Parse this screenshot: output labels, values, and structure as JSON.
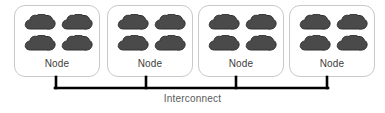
{
  "diagram": {
    "colors": {
      "cloud_fill": "#4a4a4a",
      "cloud_stroke": "#2e2e2e",
      "box_border": "#c9c9c9",
      "bus_line": "#000000",
      "node_label_color": "#3d3d3d",
      "interconnect_label_color": "#5a5a5a",
      "background": "#ffffff"
    },
    "nodes": [
      {
        "label": "Node",
        "x": 14,
        "processors": [
          "cloud-shape",
          "cloud-shape",
          "cloud-shape",
          "cloud-shape"
        ]
      },
      {
        "label": "Node",
        "x": 107,
        "processors": [
          "cloud-shape",
          "cloud-shape",
          "cloud-shape",
          "cloud-shape"
        ]
      },
      {
        "label": "Node",
        "x": 198,
        "processors": [
          "cloud-shape",
          "cloud-shape",
          "cloud-shape",
          "cloud-shape"
        ]
      },
      {
        "label": "Node",
        "x": 289,
        "processors": [
          "cloud-shape",
          "cloud-shape",
          "cloud-shape",
          "cloud-shape"
        ]
      }
    ],
    "interconnect": {
      "label": "Interconnect",
      "bus_left": 55,
      "bus_right": 328,
      "bus_y": 88,
      "stub_top": 77,
      "stub_positions": [
        55,
        146,
        236,
        328
      ]
    }
  }
}
